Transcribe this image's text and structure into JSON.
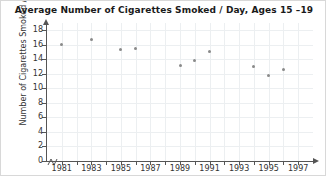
{
  "chart_data": {
    "type": "scatter",
    "title": "Average Number of Cigarettes Smoked / Day, Ages 15 –19",
    "xlabel": "",
    "ylabel": "Number of Cigarettes Smoked / Day",
    "xlim": [
      1980,
      1998
    ],
    "ylim": [
      0,
      19
    ],
    "grid": true,
    "legend": "none",
    "marker_color": "#8a8a8a",
    "gridline_color": "#eceff1",
    "axis_color": "#555555",
    "yticks": [
      0,
      2,
      4,
      6,
      8,
      10,
      12,
      14,
      16,
      18
    ],
    "ytick_labels": [
      "0",
      "2",
      "4",
      "6",
      "8",
      "10",
      "12",
      "14",
      "16",
      "18"
    ],
    "xticks": [
      1981,
      1982,
      1983,
      1984,
      1985,
      1986,
      1987,
      1988,
      1989,
      1990,
      1991,
      1992,
      1993,
      1994,
      1995,
      1996,
      1997
    ],
    "xtick_labels_major": [
      "1981",
      "1983",
      "1985",
      "1987",
      "1989",
      "1991",
      "1993",
      "1995",
      "1997"
    ],
    "xticks_major": [
      1981,
      1983,
      1985,
      1987,
      1989,
      1991,
      1993,
      1995,
      1997
    ],
    "x": [
      1981,
      1983,
      1985,
      1986,
      1989,
      1990,
      1991,
      1994,
      1995,
      1996
    ],
    "y": [
      16.1,
      16.7,
      15.3,
      15.5,
      13.2,
      13.8,
      15.1,
      13.0,
      11.8,
      12.6
    ],
    "points": [
      {
        "x": 1981,
        "y": 16.1
      },
      {
        "x": 1983,
        "y": 16.7
      },
      {
        "x": 1985,
        "y": 15.3
      },
      {
        "x": 1986,
        "y": 15.5
      },
      {
        "x": 1989,
        "y": 13.2
      },
      {
        "x": 1990,
        "y": 13.8
      },
      {
        "x": 1991,
        "y": 15.1
      },
      {
        "x": 1994,
        "y": 13.0
      },
      {
        "x": 1995,
        "y": 11.8
      },
      {
        "x": 1996,
        "y": 12.6
      }
    ]
  }
}
